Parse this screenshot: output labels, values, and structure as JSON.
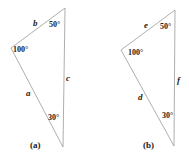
{
  "figures": [
    {
      "caption": "(a)",
      "angles": {
        "top": "50°",
        "left": "100°",
        "bottom": "30°"
      },
      "sides": {
        "top_left": "b",
        "left_bottom": "a",
        "right": "c"
      }
    },
    {
      "caption": "(b)",
      "angles": {
        "top": "50°",
        "left": "100°",
        "bottom": "30°"
      },
      "sides": {
        "top_left": "e",
        "left_bottom": "d",
        "right": "f"
      }
    }
  ],
  "colors": {
    "stroke": "#999999",
    "text": "#222222"
  }
}
